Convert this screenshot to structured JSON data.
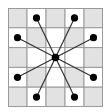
{
  "diagram": {
    "rows": 5,
    "cols": 5,
    "colors": {
      "shaded": "#e2e2e2",
      "light": "#ffffff",
      "grid_line": "#9a9a9a",
      "line": "#333333",
      "dot": "#000000"
    },
    "shading": [
      [
        1,
        0,
        1,
        0,
        1
      ],
      [
        0,
        1,
        0,
        1,
        0
      ],
      [
        1,
        0,
        0,
        0,
        1
      ],
      [
        0,
        1,
        0,
        1,
        0
      ],
      [
        1,
        0,
        1,
        0,
        1
      ]
    ],
    "center": {
      "row": 2,
      "col": 2
    },
    "targets": [
      {
        "row": 0,
        "col": 1
      },
      {
        "row": 0,
        "col": 3
      },
      {
        "row": 1,
        "col": 0
      },
      {
        "row": 1,
        "col": 4
      },
      {
        "row": 3,
        "col": 0
      },
      {
        "row": 3,
        "col": 4
      },
      {
        "row": 4,
        "col": 1
      },
      {
        "row": 4,
        "col": 3
      }
    ]
  }
}
